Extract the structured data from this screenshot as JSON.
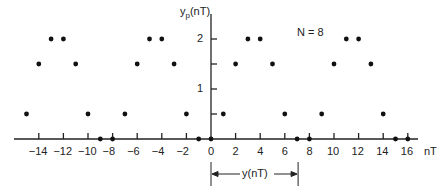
{
  "chart_data": {
    "type": "scatter",
    "title": "",
    "annotation": "N = 8",
    "xlabel": "nT",
    "ylabel": "y_p(nT)",
    "ylabel_main": "y",
    "ylabel_sub": "p",
    "ylabel_suffix": "(nT)",
    "x_ticks": [
      -14,
      -12,
      -10,
      -8,
      -6,
      -4,
      -2,
      0,
      2,
      4,
      6,
      8,
      10,
      12,
      14,
      16
    ],
    "y_ticks": [
      1,
      2
    ],
    "xlim": [
      -15.5,
      17
    ],
    "ylim": [
      0,
      2.6
    ],
    "grid": false,
    "period": 8,
    "one_period_values": [
      0,
      0.5,
      1.5,
      2,
      2,
      1.5,
      0.5,
      0
    ],
    "x": [
      -15,
      -14,
      -13,
      -12,
      -11,
      -10,
      -9,
      -8,
      -7,
      -6,
      -5,
      -4,
      -3,
      -2,
      -1,
      0,
      1,
      2,
      3,
      4,
      5,
      6,
      7,
      8,
      9,
      10,
      11,
      12,
      13,
      14,
      15,
      16
    ],
    "values": [
      0.5,
      1.5,
      2,
      2,
      1.5,
      0.5,
      0,
      0,
      0.5,
      1.5,
      2,
      2,
      1.5,
      0.5,
      0,
      0,
      0.5,
      1.5,
      2,
      2,
      1.5,
      0.5,
      0,
      0,
      0.5,
      1.5,
      2,
      2,
      1.5,
      0.5,
      0,
      0
    ],
    "bracket": {
      "label": "y(nT)",
      "from": 0,
      "to": 7
    }
  },
  "labels": {
    "n_label": "N = 8",
    "x_axis_unit": "nT",
    "bracket_label": "y(nT)"
  }
}
